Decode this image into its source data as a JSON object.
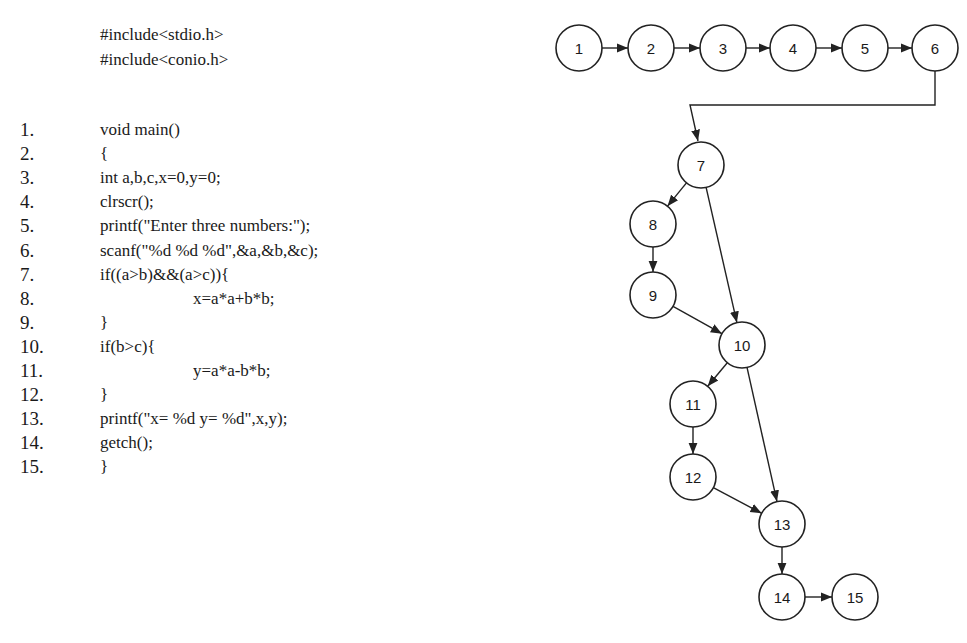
{
  "code": {
    "includes": [
      "#include<stdio.h>",
      "#include<conio.h>"
    ],
    "lines": [
      {
        "num": "1.",
        "text": "void main()",
        "indent": 0
      },
      {
        "num": "2.",
        "text": "{",
        "indent": 0
      },
      {
        "num": "3.",
        "text": "int a,b,c,x=0,y=0;",
        "indent": 0
      },
      {
        "num": "4.",
        "text": "clrscr();",
        "indent": 0
      },
      {
        "num": "5.",
        "text": "printf(\"Enter three numbers:\");",
        "indent": 0
      },
      {
        "num": "6.",
        "text": "scanf(\"%d %d %d\",&a,&b,&c);",
        "indent": 0
      },
      {
        "num": "7.",
        "text": "if((a>b)&&(a>c)){",
        "indent": 0
      },
      {
        "num": "8.",
        "text": "x=a*a+b*b;",
        "indent": 1
      },
      {
        "num": "9.",
        "text": "}",
        "indent": 0
      },
      {
        "num": "10.",
        "text": "if(b>c){",
        "indent": 0
      },
      {
        "num": "11.",
        "text": "y=a*a-b*b;",
        "indent": 1
      },
      {
        "num": "12.",
        "text": "}",
        "indent": 0
      },
      {
        "num": "13.",
        "text": "printf(\"x= %d y= %d\",x,y);",
        "indent": 0
      },
      {
        "num": "14.",
        "text": "getch();",
        "indent": 0
      },
      {
        "num": "15.",
        "text": "}",
        "indent": 0
      }
    ]
  },
  "graph": {
    "title": "Control flow graph",
    "node_radius": 23,
    "nodes": [
      {
        "id": "1",
        "label": "1",
        "x": 579,
        "y": 48
      },
      {
        "id": "2",
        "label": "2",
        "x": 651,
        "y": 48
      },
      {
        "id": "3",
        "label": "3",
        "x": 723,
        "y": 48
      },
      {
        "id": "4",
        "label": "4",
        "x": 793,
        "y": 48
      },
      {
        "id": "5",
        "label": "5",
        "x": 865,
        "y": 48
      },
      {
        "id": "6",
        "label": "6",
        "x": 935,
        "y": 48
      },
      {
        "id": "7",
        "label": "7",
        "x": 701,
        "y": 165
      },
      {
        "id": "8",
        "label": "8",
        "x": 653,
        "y": 224
      },
      {
        "id": "9",
        "label": "9",
        "x": 653,
        "y": 295
      },
      {
        "id": "10",
        "label": "10",
        "x": 742,
        "y": 345
      },
      {
        "id": "11",
        "label": "11",
        "x": 693,
        "y": 404
      },
      {
        "id": "12",
        "label": "12",
        "x": 693,
        "y": 477
      },
      {
        "id": "13",
        "label": "13",
        "x": 782,
        "y": 524
      },
      {
        "id": "14",
        "label": "14",
        "x": 782,
        "y": 597
      },
      {
        "id": "15",
        "label": "15",
        "x": 855,
        "y": 597
      }
    ],
    "edges": [
      [
        "1",
        "2"
      ],
      [
        "2",
        "3"
      ],
      [
        "3",
        "4"
      ],
      [
        "4",
        "5"
      ],
      [
        "5",
        "6"
      ],
      [
        "6",
        "7"
      ],
      [
        "7",
        "8"
      ],
      [
        "7",
        "10"
      ],
      [
        "8",
        "9"
      ],
      [
        "9",
        "10"
      ],
      [
        "10",
        "11"
      ],
      [
        "10",
        "13"
      ],
      [
        "11",
        "12"
      ],
      [
        "12",
        "13"
      ],
      [
        "13",
        "14"
      ],
      [
        "14",
        "15"
      ]
    ]
  }
}
